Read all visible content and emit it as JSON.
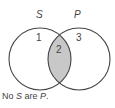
{
  "diagram": {
    "type": "venn",
    "sets": [
      {
        "name": "S",
        "label": "S"
      },
      {
        "name": "P",
        "label": "P"
      }
    ],
    "regions": [
      {
        "id": "1",
        "label": "1",
        "shaded": false
      },
      {
        "id": "2",
        "label": "2",
        "shaded": true
      },
      {
        "id": "3",
        "label": "3",
        "shaded": false
      }
    ],
    "caption": {
      "part1": "No ",
      "s": "S",
      "part2": " are ",
      "p": "P",
      "part3": "."
    },
    "colors": {
      "shade": "#c8c8c8",
      "stroke": "#444444"
    }
  }
}
